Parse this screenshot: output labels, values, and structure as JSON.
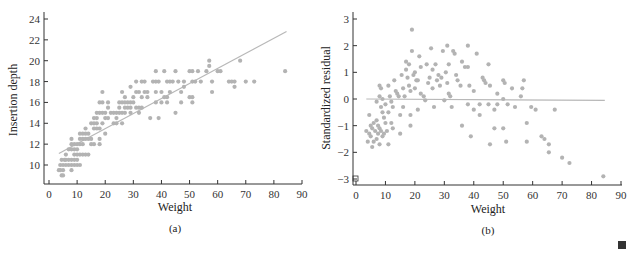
{
  "chart_data": [
    {
      "type": "scatter",
      "panel_label": "(a)",
      "xlabel": "Weight",
      "ylabel": "Insertion depth",
      "xlim": [
        0,
        90
      ],
      "ylim": [
        8.2,
        24
      ],
      "xticks": [
        0,
        10,
        20,
        30,
        40,
        50,
        60,
        70,
        80,
        90
      ],
      "yticks": [
        10,
        12,
        14,
        16,
        18,
        20,
        22,
        24
      ],
      "grid": false,
      "fit_line": {
        "x": [
          3.5,
          84.5
        ],
        "y": [
          11.1,
          22.8
        ]
      },
      "points": [
        [
          3.5,
          9.5
        ],
        [
          4,
          9.5
        ],
        [
          4.5,
          9
        ],
        [
          5,
          9
        ],
        [
          4,
          10
        ],
        [
          5,
          10
        ],
        [
          4.5,
          10.5
        ],
        [
          5.5,
          10.5
        ],
        [
          5,
          9.5
        ],
        [
          6,
          10
        ],
        [
          7,
          10
        ],
        [
          8,
          10
        ],
        [
          9,
          10
        ],
        [
          10,
          10
        ],
        [
          11,
          10
        ],
        [
          8,
          9.5
        ],
        [
          6,
          10.5
        ],
        [
          7,
          10.5
        ],
        [
          8,
          10.5
        ],
        [
          9,
          10.5
        ],
        [
          10,
          10.5
        ],
        [
          6,
          11
        ],
        [
          7,
          11.5
        ],
        [
          8,
          11.5
        ],
        [
          9,
          11
        ],
        [
          10,
          11
        ],
        [
          11,
          11
        ],
        [
          12,
          11
        ],
        [
          13,
          11
        ],
        [
          14,
          11
        ],
        [
          8,
          12
        ],
        [
          9,
          12
        ],
        [
          10,
          12
        ],
        [
          11,
          12
        ],
        [
          12,
          12
        ],
        [
          9,
          11.5
        ],
        [
          10,
          11.5
        ],
        [
          8,
          12.5
        ],
        [
          11,
          12.5
        ],
        [
          12,
          12.5
        ],
        [
          13,
          12.5
        ],
        [
          14,
          12.5
        ],
        [
          15,
          12.5
        ],
        [
          11,
          13
        ],
        [
          12,
          13
        ],
        [
          13,
          13
        ],
        [
          14,
          13
        ],
        [
          15,
          12
        ],
        [
          16,
          12
        ],
        [
          18,
          12
        ],
        [
          18,
          12.5
        ],
        [
          20,
          13
        ],
        [
          13,
          13.5
        ],
        [
          16,
          13.5
        ],
        [
          17,
          13.5
        ],
        [
          18,
          13.5
        ],
        [
          15,
          14
        ],
        [
          16,
          14
        ],
        [
          17,
          14
        ],
        [
          19,
          14
        ],
        [
          20,
          14.5
        ],
        [
          21,
          14.5
        ],
        [
          16,
          14.5
        ],
        [
          17,
          14.5
        ],
        [
          17,
          15
        ],
        [
          18,
          15
        ],
        [
          19,
          15
        ],
        [
          20,
          15
        ],
        [
          22,
          15
        ],
        [
          23,
          15
        ],
        [
          24,
          15
        ],
        [
          25,
          15
        ],
        [
          26,
          15
        ],
        [
          27,
          15
        ],
        [
          29,
          15
        ],
        [
          32,
          15
        ],
        [
          18,
          16
        ],
        [
          19,
          16
        ],
        [
          21,
          16
        ],
        [
          21,
          15.5
        ],
        [
          23,
          14
        ],
        [
          24,
          14
        ],
        [
          26,
          14
        ],
        [
          24,
          14.5
        ],
        [
          25,
          16
        ],
        [
          26,
          16
        ],
        [
          27,
          16
        ],
        [
          28,
          16
        ],
        [
          29,
          16
        ],
        [
          30,
          16
        ],
        [
          25,
          15.5
        ],
        [
          27,
          15.5
        ],
        [
          28,
          15.5
        ],
        [
          29,
          15.5
        ],
        [
          31,
          15.5
        ],
        [
          32,
          15.5
        ],
        [
          33,
          15.5
        ],
        [
          19,
          17
        ],
        [
          26,
          17
        ],
        [
          27,
          16.5
        ],
        [
          30,
          16.5
        ],
        [
          33,
          16.5
        ],
        [
          35,
          16.5
        ],
        [
          36,
          14.5
        ],
        [
          39,
          14.5
        ],
        [
          29,
          17.5
        ],
        [
          31,
          17
        ],
        [
          32,
          17
        ],
        [
          34,
          17
        ],
        [
          35,
          17
        ],
        [
          38,
          17
        ],
        [
          40,
          17
        ],
        [
          43,
          17
        ],
        [
          47,
          17
        ],
        [
          31,
          18
        ],
        [
          33,
          18
        ],
        [
          34,
          18
        ],
        [
          37,
          18
        ],
        [
          38,
          18
        ],
        [
          39,
          18
        ],
        [
          42,
          18
        ],
        [
          43,
          18
        ],
        [
          44,
          18
        ],
        [
          46,
          18
        ],
        [
          48,
          18
        ],
        [
          51,
          18
        ],
        [
          52,
          18
        ],
        [
          54,
          18
        ],
        [
          58,
          18
        ],
        [
          38,
          16
        ],
        [
          40,
          16
        ],
        [
          42,
          16
        ],
        [
          41,
          16.5
        ],
        [
          42,
          16.5
        ],
        [
          47,
          16
        ],
        [
          45,
          15
        ],
        [
          48,
          17.5
        ],
        [
          38,
          19
        ],
        [
          41,
          19
        ],
        [
          45,
          19
        ],
        [
          50,
          19
        ],
        [
          51,
          19
        ],
        [
          53,
          19
        ],
        [
          56,
          19
        ],
        [
          57,
          19.5
        ],
        [
          57,
          20
        ],
        [
          60,
          19
        ],
        [
          61,
          19
        ],
        [
          50,
          16.5
        ],
        [
          51,
          16.5
        ],
        [
          51,
          16
        ],
        [
          58,
          17
        ],
        [
          64,
          18
        ],
        [
          65,
          18
        ],
        [
          66,
          18
        ],
        [
          66,
          17.5
        ],
        [
          68,
          20
        ],
        [
          70,
          18
        ],
        [
          73,
          18
        ],
        [
          84,
          19
        ]
      ]
    },
    {
      "type": "scatter",
      "panel_label": "(b)",
      "xlabel": "Weight",
      "ylabel": "Standardized residual",
      "xlim": [
        0,
        90
      ],
      "ylim": [
        -3.2,
        3
      ],
      "xticks": [
        0,
        10,
        20,
        30,
        40,
        50,
        60,
        70,
        80,
        90
      ],
      "yticks": [
        -3,
        -2,
        -1,
        0,
        1,
        2,
        3
      ],
      "grid": false,
      "reference_line": {
        "x": [
          3.5,
          84.5
        ],
        "y": [
          0,
          -0.05
        ]
      },
      "points": [
        [
          3.5,
          -1.2
        ],
        [
          4,
          -1.6
        ],
        [
          4.5,
          -1.3
        ],
        [
          5,
          -1.4
        ],
        [
          5.5,
          -1.8
        ],
        [
          4.5,
          -0.6
        ],
        [
          5,
          -1.0
        ],
        [
          5.5,
          -1.1
        ],
        [
          6,
          -0.9
        ],
        [
          6.5,
          -1.2
        ],
        [
          7,
          -1.5
        ],
        [
          7.5,
          -1.3
        ],
        [
          6,
          -1.6
        ],
        [
          7,
          -0.1
        ],
        [
          7,
          -0.8
        ],
        [
          7.5,
          -1.0
        ],
        [
          8,
          -1.1
        ],
        [
          8.5,
          -1.2
        ],
        [
          9,
          -1.4
        ],
        [
          9.5,
          -1.3
        ],
        [
          8,
          -1.7
        ],
        [
          8,
          0.5
        ],
        [
          8.5,
          0.4
        ],
        [
          8,
          0.1
        ],
        [
          8.5,
          -0.3
        ],
        [
          9,
          -0.5
        ],
        [
          9.5,
          -0.7
        ],
        [
          10,
          -0.9
        ],
        [
          10.5,
          -1.2
        ],
        [
          11,
          -1.7
        ],
        [
          9,
          0
        ],
        [
          10,
          -0.2
        ],
        [
          11,
          -0.5
        ],
        [
          12,
          -0.9
        ],
        [
          12.5,
          -1.1
        ],
        [
          11,
          0.5
        ],
        [
          11.5,
          0.1
        ],
        [
          12,
          -0.1
        ],
        [
          12.5,
          -0.3
        ],
        [
          13,
          0.7
        ],
        [
          13.5,
          0.3
        ],
        [
          14,
          0.2
        ],
        [
          14.5,
          0.1
        ],
        [
          15,
          -0.6
        ],
        [
          15,
          -1.3
        ],
        [
          15.5,
          0.9
        ],
        [
          16,
          0.4
        ],
        [
          16,
          -0.3
        ],
        [
          16.5,
          0.1
        ],
        [
          17,
          1.1
        ],
        [
          17,
          1.4
        ],
        [
          17.5,
          0.8
        ],
        [
          18,
          0.5
        ],
        [
          18,
          1.3
        ],
        [
          18.5,
          0.3
        ],
        [
          18.5,
          -0.6
        ],
        [
          18.5,
          -1.0
        ],
        [
          19,
          1.8
        ],
        [
          19,
          2.6
        ],
        [
          19.5,
          0.9
        ],
        [
          20,
          1.0
        ],
        [
          20,
          0.4
        ],
        [
          20.5,
          0.7
        ],
        [
          21,
          0.7
        ],
        [
          21,
          -0.4
        ],
        [
          21.5,
          1.6
        ],
        [
          22,
          1.2
        ],
        [
          22,
          0.2
        ],
        [
          23,
          0.1
        ],
        [
          23.5,
          -0.05
        ],
        [
          24,
          1.3
        ],
        [
          24.5,
          0.6
        ],
        [
          25,
          0.8
        ],
        [
          25.5,
          1.9
        ],
        [
          26,
          1.1
        ],
        [
          26,
          0.4
        ],
        [
          26.5,
          -0.3
        ],
        [
          27,
          1.3
        ],
        [
          27.5,
          0.7
        ],
        [
          28,
          0.9
        ],
        [
          28.5,
          0.5
        ],
        [
          29,
          0.8
        ],
        [
          29.5,
          1.8
        ],
        [
          30,
          -0.05
        ],
        [
          30.5,
          1.0
        ],
        [
          31,
          2.0
        ],
        [
          31.5,
          1.3
        ],
        [
          31,
          0.6
        ],
        [
          31.5,
          0.2
        ],
        [
          32,
          0.1
        ],
        [
          32.5,
          -0.3
        ],
        [
          33,
          1.8
        ],
        [
          33.5,
          1.7
        ],
        [
          34,
          0.9
        ],
        [
          34.5,
          0.7
        ],
        [
          35.5,
          0.5
        ],
        [
          36,
          1.4
        ],
        [
          36,
          -1.0
        ],
        [
          37,
          1.2
        ],
        [
          38,
          2.0
        ],
        [
          38,
          1.2
        ],
        [
          38.5,
          0.5
        ],
        [
          38,
          -0.2
        ],
        [
          39,
          -1.4
        ],
        [
          40,
          0.3
        ],
        [
          40,
          -0.4
        ],
        [
          41,
          1.7
        ],
        [
          42,
          -0.2
        ],
        [
          42,
          -0.6
        ],
        [
          43,
          0.8
        ],
        [
          43.5,
          0.7
        ],
        [
          44,
          0.6
        ],
        [
          45,
          1.3
        ],
        [
          45,
          -0.2
        ],
        [
          45.5,
          0.5
        ],
        [
          45.5,
          -1.7
        ],
        [
          47,
          -0.4
        ],
        [
          47,
          -1.1
        ],
        [
          48,
          0.2
        ],
        [
          48,
          -0.2
        ],
        [
          50,
          0.7
        ],
        [
          50,
          0
        ],
        [
          50,
          -1.1
        ],
        [
          50.5,
          0.6
        ],
        [
          51,
          -1.6
        ],
        [
          51.5,
          -0.2
        ],
        [
          53,
          0.4
        ],
        [
          54,
          -0.3
        ],
        [
          56,
          0.1
        ],
        [
          56.5,
          0.4
        ],
        [
          57,
          0.7
        ],
        [
          58,
          -0.9
        ],
        [
          58,
          -1.6
        ],
        [
          59.5,
          -0.3
        ],
        [
          61,
          -0.4
        ],
        [
          63,
          -1.4
        ],
        [
          64,
          -1.5
        ],
        [
          65.5,
          -1.7
        ],
        [
          65.5,
          -2.0
        ],
        [
          67.5,
          -0.4
        ],
        [
          70,
          -2.2
        ],
        [
          72.5,
          -2.4
        ],
        [
          84,
          -2.9
        ]
      ]
    }
  ],
  "panels": {
    "a": {
      "caption": "(a)",
      "xlabel": "Weight",
      "ylabel": "Insertion depth",
      "xtick_labels": [
        "0",
        "10",
        "20",
        "30",
        "40",
        "50",
        "60",
        "70",
        "80",
        "90"
      ],
      "ytick_labels": [
        "10",
        "12",
        "14",
        "16",
        "18",
        "20",
        "22",
        "24"
      ]
    },
    "b": {
      "caption": "(b)",
      "xlabel": "Weight",
      "ylabel": "Standardized residual",
      "xtick_labels": [
        "0",
        "10",
        "20",
        "30",
        "40",
        "50",
        "60",
        "70",
        "80",
        "90"
      ],
      "ytick_labels": [
        "3",
        "2",
        "1",
        "0",
        "−1",
        "−2",
        "−3"
      ]
    }
  },
  "colors": {
    "point": "#b3b3b3",
    "line": "#b8b8b8",
    "axis": "#333333",
    "end_mark": "#333333"
  }
}
